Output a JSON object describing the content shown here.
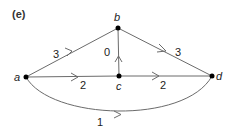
{
  "figure": {
    "panel_label": "(e)"
  },
  "nodes": [
    {
      "id": "a",
      "label": "a",
      "x": 26,
      "y": 77
    },
    {
      "id": "b",
      "label": "b",
      "x": 118,
      "y": 28
    },
    {
      "id": "c",
      "label": "c",
      "x": 119,
      "y": 76
    },
    {
      "id": "d",
      "label": "d",
      "x": 212,
      "y": 76
    }
  ],
  "edges": [
    {
      "from": "a",
      "to": "b",
      "weight": "3"
    },
    {
      "from": "b",
      "to": "d",
      "weight": "3"
    },
    {
      "from": "c",
      "to": "b",
      "weight": "0"
    },
    {
      "from": "a",
      "to": "c",
      "weight": "2"
    },
    {
      "from": "c",
      "to": "d",
      "weight": "2"
    },
    {
      "from": "a",
      "to": "d",
      "weight": "1",
      "curved": true
    }
  ],
  "colors": {
    "edge": "#6b6b6b",
    "node": "#000000",
    "text": "#222222"
  }
}
